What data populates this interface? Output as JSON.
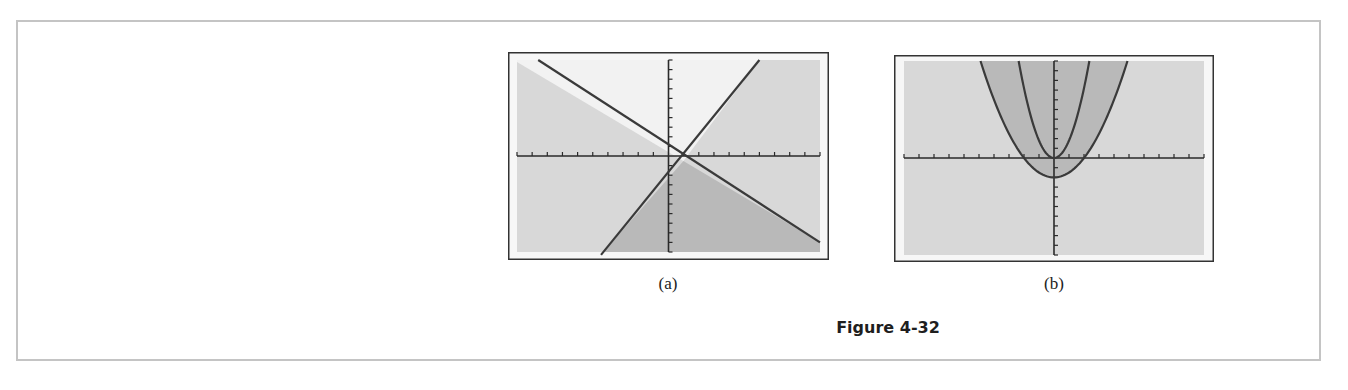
{
  "figure": {
    "caption": "Figure 4-32",
    "panels": [
      {
        "label": "(a)"
      },
      {
        "label": "(b)"
      }
    ]
  },
  "colors": {
    "line": "#3a3a3a",
    "axis": "#2a2a2a",
    "region_white": "#f2f2f2",
    "region_light": "#d8d8d8",
    "region_dark": "#b9b9b9",
    "frame": "#333333"
  },
  "chart_data": [
    {
      "type": "line",
      "title": "(a)",
      "xlabel": "",
      "ylabel": "",
      "xlim": [
        -10,
        10
      ],
      "ylim": [
        -10,
        10
      ],
      "x_ticks_per_side": 10,
      "y_ticks_per_side": 10,
      "grid": false,
      "series": [
        {
          "name": "decreasing line",
          "points": [
            [
              -10,
              9.8
            ],
            [
              10,
              -9.0
            ]
          ],
          "approx_equation": "y = -0.63x + 0.6"
        },
        {
          "name": "increasing line",
          "points": [
            [
              -4.3,
              -10
            ],
            [
              6.0,
              10
            ]
          ],
          "approx_equation": "y = 1.3x - 1.3"
        }
      ],
      "intersection": [
        1,
        0
      ],
      "shading": {
        "white": "region above both lines (top, between lines)",
        "dark": "region below decreasing line and right of increasing line (bottom)",
        "light": "left and right regions"
      }
    },
    {
      "type": "line",
      "title": "(b)",
      "xlabel": "",
      "ylabel": "",
      "xlim": [
        -10,
        10
      ],
      "ylim": [
        -10,
        10
      ],
      "x_ticks_per_side": 10,
      "y_ticks_per_side": 10,
      "grid": false,
      "series": [
        {
          "name": "inner parabola",
          "approx_equation": "y = 1.8x^2",
          "vertex": [
            0,
            0
          ]
        },
        {
          "name": "outer parabola",
          "approx_equation": "y = 0.5x^2 - 2",
          "vertex": [
            0,
            -2
          ]
        }
      ],
      "shading": {
        "dark": "inside outer parabola (above it)",
        "light": "outside outer parabola"
      }
    }
  ]
}
